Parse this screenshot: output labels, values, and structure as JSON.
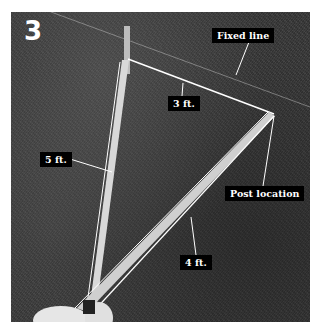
{
  "figure": {
    "step_number": "3",
    "labels": {
      "fixed_line": "Fixed line",
      "three_ft": "3 ft.",
      "five_ft": "5 ft.",
      "post_location": "Post location",
      "four_ft": "4 ft."
    },
    "colors": {
      "label_bg": "#000000",
      "label_text": "#ffffff",
      "line": "#ffffff",
      "ground": "#3c3c3c"
    }
  }
}
